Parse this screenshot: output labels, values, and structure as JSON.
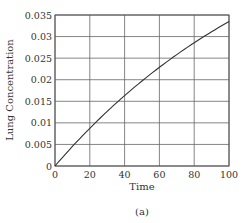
{
  "chart_data": {
    "type": "line",
    "title": "",
    "xlabel": "Time",
    "ylabel": "Lung Concentration",
    "caption": "(a)",
    "xlim": [
      0,
      100
    ],
    "ylim": [
      0,
      0.035
    ],
    "x_ticks": [
      "0",
      "20",
      "40",
      "60",
      "80",
      "100"
    ],
    "y_ticks": [
      "0",
      "0.005",
      "0.01",
      "0.015",
      "0.02",
      "0.025",
      "0.03",
      "0.035"
    ],
    "grid": true,
    "legend": null,
    "series": [
      {
        "name": "Lung Concentration",
        "color": "#333333",
        "x": [
          0,
          10,
          20,
          30,
          40,
          50,
          60,
          70,
          80,
          90,
          100
        ],
        "y": [
          0,
          0.0053,
          0.01,
          0.0141,
          0.0175,
          0.0208,
          0.0238,
          0.0266,
          0.0292,
          0.0314,
          0.0335
        ]
      }
    ]
  },
  "axis": {
    "xlabel": "Time",
    "ylabel": "Lung Concentration",
    "caption": "(a)"
  }
}
